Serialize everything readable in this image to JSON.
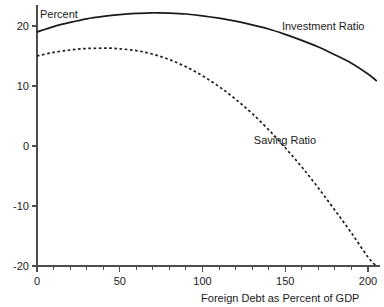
{
  "chart_data": {
    "type": "line",
    "title": "",
    "xlabel": "Foreign Debt as Percent of GDP",
    "ylabel": "Percent",
    "xlim": [
      0,
      207
    ],
    "ylim": [
      -20,
      23.5
    ],
    "grid": false,
    "legend": "inline-labels",
    "x_ticks": [
      0,
      50,
      100,
      150,
      200
    ],
    "x_tick_labels": [
      "0",
      "50",
      "100",
      "150",
      "200"
    ],
    "x_minor_step": 10,
    "y_ticks": [
      20,
      10,
      0,
      -10,
      -20
    ],
    "y_tick_labels": [
      "20",
      "10",
      "0",
      "-10",
      "-20"
    ],
    "series": [
      {
        "name": "Investment Ratio",
        "style": "solid",
        "color": "#1a1a1a",
        "label_x": 148,
        "label_y": 19.3,
        "x": [
          0,
          10,
          20,
          30,
          40,
          50,
          60,
          70,
          72,
          80,
          90,
          100,
          110,
          120,
          130,
          140,
          150,
          160,
          170,
          180,
          190,
          200,
          205
        ],
        "y": [
          19.0,
          19.9,
          20.6,
          21.2,
          21.6,
          21.9,
          22.1,
          22.2,
          22.2,
          22.15,
          22.0,
          21.7,
          21.3,
          20.8,
          20.2,
          19.5,
          18.6,
          17.6,
          16.5,
          15.2,
          13.8,
          12.0,
          10.9
        ]
      },
      {
        "name": "Saving Ratio",
        "style": "dashed",
        "color": "#1a1a1a",
        "label_x": 131,
        "label_y": 0.4,
        "x": [
          0,
          10,
          20,
          30,
          40,
          45,
          50,
          60,
          70,
          80,
          90,
          100,
          110,
          120,
          130,
          140,
          150,
          160,
          170,
          180,
          190,
          200,
          205
        ],
        "y": [
          15.0,
          15.6,
          16.0,
          16.25,
          16.3,
          16.3,
          16.2,
          15.9,
          15.3,
          14.4,
          13.2,
          11.7,
          9.9,
          7.8,
          5.4,
          2.7,
          -0.3,
          -3.5,
          -7.0,
          -10.7,
          -14.5,
          -18.5,
          -20.0
        ]
      }
    ]
  },
  "axis": {
    "y_title": "Percent",
    "x_title": "Foreign Debt as Percent of GDP"
  }
}
